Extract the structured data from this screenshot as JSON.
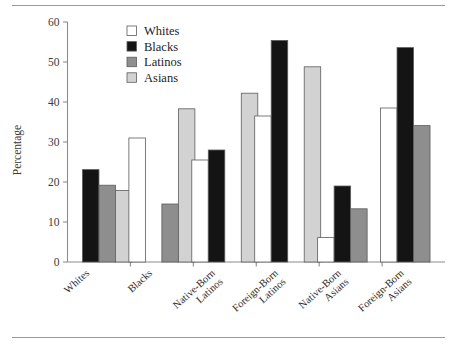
{
  "figure": {
    "top_rule": true,
    "bottom_rule": true,
    "background": "#ffffff"
  },
  "chart_data": {
    "type": "bar",
    "title": "",
    "subtitle": "",
    "xlabel": "",
    "ylabel": "Percentage",
    "ylim": [
      0,
      60
    ],
    "yticks": [
      0,
      10,
      20,
      30,
      40,
      50,
      60
    ],
    "ytick_labels": [
      "0",
      "10",
      "20",
      "30",
      "40",
      "50",
      "60"
    ],
    "grid": false,
    "legend_position": "top-center",
    "categories": [
      "Whites",
      "Blacks",
      "Native-Born\nLatinos",
      "Foreign-Born\nLatinos",
      "Native-Born\nAsians",
      "Foreign-Born\nAsians"
    ],
    "category_lines": [
      [
        "Whites"
      ],
      [
        "Blacks"
      ],
      [
        "Native-Born",
        "Latinos"
      ],
      [
        "Foreign-Born",
        "Latinos"
      ],
      [
        "Native-Born",
        "Asians"
      ],
      [
        "Foreign-Born",
        "Asians"
      ]
    ],
    "series": [
      {
        "name": "Whites",
        "color": "#ffffff",
        "values": [
          null,
          31.0,
          25.5,
          36.5,
          6.1,
          38.5
        ]
      },
      {
        "name": "Blacks",
        "color": "#141414",
        "values": [
          23.1,
          null,
          28.0,
          55.4,
          19.0,
          53.6
        ]
      },
      {
        "name": "Latinos",
        "color": "#8e8e8e",
        "values": [
          19.2,
          14.5,
          null,
          null,
          13.3,
          34.1
        ]
      },
      {
        "name": "Asians",
        "color": "#d2d2d2",
        "values": [
          17.9,
          38.3,
          42.2,
          48.8,
          null,
          null
        ]
      }
    ]
  },
  "legend": {
    "entries": [
      {
        "label": "Whites",
        "color": "#ffffff"
      },
      {
        "label": "Blacks",
        "color": "#141414"
      },
      {
        "label": "Latinos",
        "color": "#8e8e8e"
      },
      {
        "label": "Asians",
        "color": "#d2d2d2"
      }
    ]
  }
}
